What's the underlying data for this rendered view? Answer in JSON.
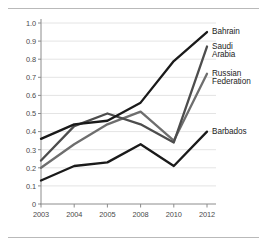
{
  "chart_data": {
    "type": "line",
    "title": "",
    "subtitle": "",
    "xlabel": "",
    "ylabel": "",
    "categories": [
      "2003",
      "2004",
      "2005",
      "2008",
      "2010",
      "2012"
    ],
    "ylim": [
      0,
      1.0
    ],
    "yticks": [
      "0",
      "0.1",
      "0.2",
      "0.3",
      "0.4",
      "0.5",
      "0.6",
      "0.7",
      "0.8",
      "0.9",
      "1.0"
    ],
    "ytick_values": [
      0,
      0.1,
      0.2,
      0.3,
      0.4,
      0.5,
      0.6,
      0.7,
      0.8,
      0.9,
      1.0
    ],
    "grid": "horizontal",
    "legend_position": "right-inline-end-of-line",
    "series": [
      {
        "name": "Bahrain",
        "color": "#1a1a1a",
        "values": [
          0.36,
          0.44,
          0.46,
          0.56,
          0.79,
          0.95
        ]
      },
      {
        "name": "Saudi Arabia",
        "color": "#4d4d4d",
        "values": [
          0.24,
          0.43,
          0.5,
          0.44,
          0.34,
          0.87
        ]
      },
      {
        "name": "Russian Federation",
        "color": "#6e6e6e",
        "values": [
          0.2,
          0.33,
          0.44,
          0.51,
          0.35,
          0.72
        ]
      },
      {
        "name": "Barbados",
        "color": "#1a1a1a",
        "values": [
          0.13,
          0.21,
          0.23,
          0.33,
          0.21,
          0.4
        ]
      }
    ]
  },
  "labels": {
    "bahrain": "Bahrain",
    "saudi_line1": "Saudi",
    "saudi_line2": "Arabia",
    "russian_line1": "Russian",
    "russian_line2": "Federation",
    "barbados": "Barbados"
  },
  "colors": {
    "axis": "#8c8c8c",
    "grid": "#e4e4e4",
    "rule": "#b9b9b9",
    "tick_text": "#4a4a4a",
    "label_text": "#1d1d1d"
  }
}
